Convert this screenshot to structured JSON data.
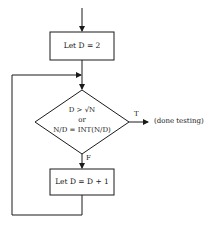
{
  "flowchart": {
    "nodes": {
      "init": {
        "type": "process",
        "label": "Let D = 2"
      },
      "decision": {
        "type": "decision",
        "lines": [
          "D > √N",
          "or",
          "N/D = INT(N/D)"
        ]
      },
      "increment": {
        "type": "process",
        "label": "Let D = D + 1"
      },
      "exit": {
        "type": "terminal-text",
        "label": "(done testing)"
      }
    },
    "edges": {
      "true_label": "T",
      "false_label": "F"
    },
    "colors": {
      "stroke": "#1a1a1a",
      "background": "#ffffff"
    }
  }
}
